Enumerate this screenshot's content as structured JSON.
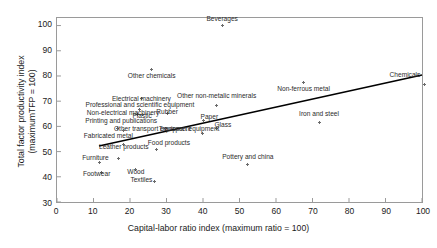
{
  "chart_data": {
    "type": "scatter",
    "title": "",
    "xlabel": "Capital-labor ratio index (maximum ratio = 100)",
    "ylabel": "Total factor productivity index (maximumTFP = 100)",
    "ylabel_line1": "Total factor productivity index",
    "ylabel_line2": "(maximumTFP = 100)",
    "xlim": [
      0,
      100
    ],
    "ylim": [
      30,
      103
    ],
    "xticks": [
      0,
      10,
      20,
      30,
      40,
      50,
      60,
      70,
      80,
      90,
      100
    ],
    "yticks": [
      30,
      40,
      50,
      60,
      70,
      80,
      90,
      100
    ],
    "grid": false,
    "legend": "none",
    "marker": "asterisk",
    "marker_color": "#6b6b6b",
    "trendline": {
      "name": "linear fit",
      "color": "#000000",
      "x_start": 11.5,
      "y_start": 52.2,
      "x_end": 100.0,
      "y_end": 80.4
    },
    "points": [
      {
        "label": "Beverages",
        "x": 45.0,
        "y": 100.0,
        "lx": 45.0,
        "ly": 102.6,
        "align": "center"
      },
      {
        "label": "Other chemicals",
        "x": 25.8,
        "y": 82.6,
        "lx": 25.8,
        "ly": 80.3,
        "align": "center"
      },
      {
        "label": "Chemicals",
        "x": 100.0,
        "y": 76.8,
        "lx": 99.0,
        "ly": 80.7,
        "align": "right"
      },
      {
        "label": "Non-ferrous metal",
        "x": 67.2,
        "y": 77.5,
        "lx": 67.2,
        "ly": 75.1,
        "align": "center"
      },
      {
        "label": "Other non-metalic minerals",
        "x": 43.5,
        "y": 68.6,
        "lx": 43.5,
        "ly": 72.2,
        "align": "center"
      },
      {
        "label": "Electrical machinery",
        "x": 23.0,
        "y": 71.3,
        "lx": 23.0,
        "ly": 71.4,
        "align": "center"
      },
      {
        "label": "Professional and scientific equipment",
        "x": 22.6,
        "y": 67.0,
        "lx": 22.6,
        "ly": 68.8,
        "align": "center"
      },
      {
        "label": "Non-electrical machinery",
        "x": 22.0,
        "y": 65.1,
        "lx": 18.0,
        "ly": 65.6,
        "align": "center"
      },
      {
        "label": "Plastic",
        "x": 23.2,
        "y": 65.0,
        "lx": 23.2,
        "ly": 64.6,
        "align": "center"
      },
      {
        "label": "Rubber",
        "x": 30.0,
        "y": 65.5,
        "lx": 30.0,
        "ly": 66.3,
        "align": "center"
      },
      {
        "label": "Iron and steel",
        "x": 71.4,
        "y": 62.0,
        "lx": 71.4,
        "ly": 65.3,
        "align": "center"
      },
      {
        "label": "Paper",
        "x": 40.0,
        "y": 62.6,
        "lx": 41.5,
        "ly": 64.0,
        "align": "center"
      },
      {
        "label": "Glass",
        "x": 43.5,
        "y": 59.5,
        "lx": 45.2,
        "ly": 61.2,
        "align": "center"
      },
      {
        "label": "Printing and publications",
        "x": 16.5,
        "y": 59.6,
        "lx": 17.5,
        "ly": 62.6,
        "align": "center"
      },
      {
        "label": "Other transport equipment",
        "x": 29.6,
        "y": 59.8,
        "lx": 26.0,
        "ly": 59.3,
        "align": "center"
      },
      {
        "label": "Transport equipment",
        "x": 39.6,
        "y": 57.8,
        "lx": 36.0,
        "ly": 59.3,
        "align": "center"
      },
      {
        "label": "Fabricated metal",
        "x": 18.2,
        "y": 59.0,
        "lx": 14.0,
        "ly": 56.6,
        "align": "center"
      },
      {
        "label": "Leather products",
        "x": 18.2,
        "y": 53.5,
        "lx": 18.2,
        "ly": 52.3,
        "align": "center"
      },
      {
        "label": "Food products",
        "x": 27.0,
        "y": 51.4,
        "lx": 30.5,
        "ly": 54.0,
        "align": "center"
      },
      {
        "label": "Pottery and china",
        "x": 52.0,
        "y": 45.5,
        "lx": 52.0,
        "ly": 48.6,
        "align": "center"
      },
      {
        "label": "Furniture",
        "x": 11.7,
        "y": 46.2,
        "lx": 10.5,
        "ly": 48.0,
        "align": "center"
      },
      {
        "label": "Footwear",
        "x": 12.0,
        "y": 42.3,
        "lx": 10.8,
        "ly": 41.7,
        "align": "center"
      },
      {
        "label": "Wood",
        "x": 21.5,
        "y": 43.5,
        "lx": 21.5,
        "ly": 42.6,
        "align": "center"
      },
      {
        "label": "Textiles",
        "x": 26.7,
        "y": 38.7,
        "lx": 23.0,
        "ly": 39.3,
        "align": "center"
      },
      {
        "label": "Leather products 2",
        "x": 16.8,
        "y": 47.8,
        "lx": 0,
        "ly": 0,
        "align": "none"
      }
    ]
  }
}
